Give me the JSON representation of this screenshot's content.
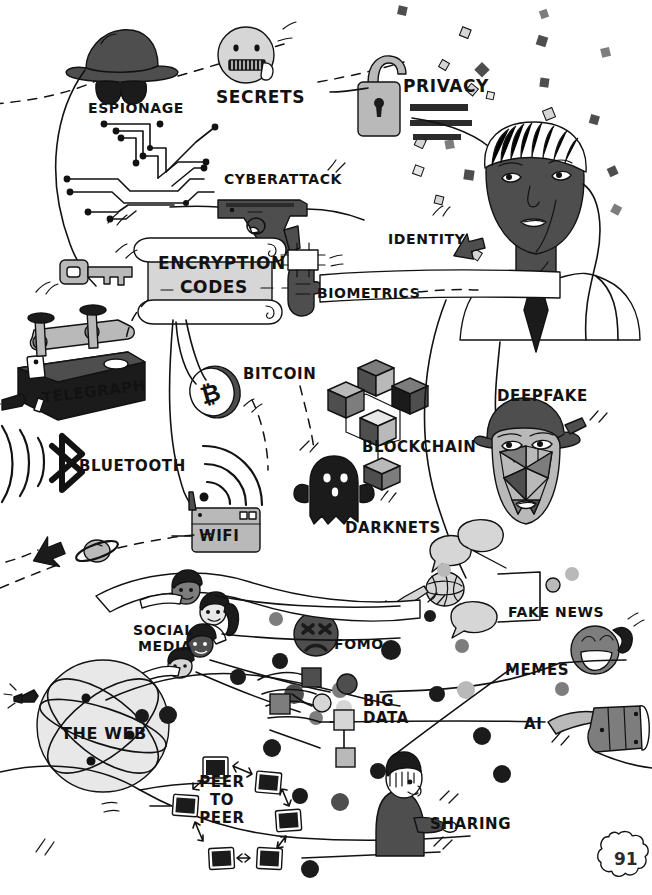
{
  "page": {
    "page_number": "91",
    "background_color": "#ffffff",
    "ink_color": "#121212"
  },
  "palette": {
    "ink": "#121212",
    "black_fill": "#1b1b1b",
    "dark_gray": "#4e4e4e",
    "mid_gray": "#7d7d7d",
    "light_gray": "#b9b9b9",
    "pale_gray": "#d6d6d6",
    "very_pale": "#e8e8e8"
  },
  "labels": [
    {
      "id": "espionage",
      "text": "ESPIONAGE",
      "x": 88,
      "y": 101,
      "size": 14,
      "align": "left",
      "icon": "spy-hat-sunglasses-icon"
    },
    {
      "id": "secrets",
      "text": "SECRETS",
      "x": 216,
      "y": 89,
      "size": 17,
      "align": "left",
      "icon": "zipper-mouth-face-icon"
    },
    {
      "id": "privacy",
      "text": "PRIVACY",
      "x": 403,
      "y": 78,
      "size": 17,
      "align": "left",
      "icon": "open-padlock-icon"
    },
    {
      "id": "cyberattack",
      "text": "CYBERATTACK",
      "x": 224,
      "y": 172,
      "size": 14,
      "align": "left",
      "icon": "handgun-icon"
    },
    {
      "id": "identity",
      "text": "IDENTITY",
      "x": 388,
      "y": 232,
      "size": 14,
      "align": "left",
      "icon": "arrow-pointing-icon"
    },
    {
      "id": "encryption",
      "text": "ENCRYPTION",
      "x": 158,
      "y": 255,
      "size": 17,
      "align": "left",
      "icon": "scroll-icon"
    },
    {
      "id": "codes",
      "text": "CODES",
      "x": 180,
      "y": 279,
      "size": 17,
      "align": "left",
      "icon": "scroll-icon"
    },
    {
      "id": "biometrics",
      "text": "BIOMETRICS",
      "x": 317,
      "y": 286,
      "size": 14,
      "align": "left",
      "icon": "thumbprint-scanner-icon"
    },
    {
      "id": "telegraph",
      "text": "TELEGRAPH",
      "x": 41,
      "y": 391,
      "size": 15,
      "align": "left",
      "icon": "telegraph-key-icon"
    },
    {
      "id": "bitcoin",
      "text": "BITCOIN",
      "x": 243,
      "y": 367,
      "size": 15,
      "align": "left",
      "icon": "bitcoin-coin-icon"
    },
    {
      "id": "deepfake",
      "text": "DEEPFAKE",
      "x": 497,
      "y": 389,
      "size": 15,
      "align": "left",
      "icon": "deepfake-mask-icon"
    },
    {
      "id": "blockchain",
      "text": "BLOCKCHAIN",
      "x": 362,
      "y": 440,
      "size": 15,
      "align": "left",
      "icon": "linked-cubes-icon"
    },
    {
      "id": "bluetooth",
      "text": "BLUETOOTH",
      "x": 79,
      "y": 459,
      "size": 15,
      "align": "left",
      "icon": "bluetooth-icon"
    },
    {
      "id": "wifi",
      "text": "WIFI",
      "x": 199,
      "y": 529,
      "size": 15,
      "align": "left",
      "icon": "wifi-router-icon"
    },
    {
      "id": "darknets",
      "text": "DARKNETS",
      "x": 345,
      "y": 521,
      "size": 15,
      "align": "left",
      "icon": "ghost-icon"
    },
    {
      "id": "fake_news",
      "text": "FAKE NEWS",
      "x": 508,
      "y": 605,
      "size": 14,
      "align": "left",
      "icon": "microphone-speech-bubbles-icon"
    },
    {
      "id": "social_1",
      "text": "SOCIAL",
      "x": 133,
      "y": 623,
      "size": 14,
      "align": "left",
      "icon": "people-chain-icon"
    },
    {
      "id": "social_2",
      "text": "MEDIA",
      "x": 138,
      "y": 639,
      "size": 14,
      "align": "left",
      "icon": "people-chain-icon"
    },
    {
      "id": "fomo",
      "text": "FOMO",
      "x": 334,
      "y": 637,
      "size": 14,
      "align": "left",
      "icon": "distressed-face-icon"
    },
    {
      "id": "memes",
      "text": "MEMES",
      "x": 505,
      "y": 663,
      "size": 15,
      "align": "left",
      "icon": "laughing-face-icon"
    },
    {
      "id": "bigdata_1",
      "text": "BIG",
      "x": 363,
      "y": 694,
      "size": 15,
      "align": "left",
      "icon": "node-graph-icon"
    },
    {
      "id": "bigdata_2",
      "text": "DATA",
      "x": 363,
      "y": 711,
      "size": 15,
      "align": "left",
      "icon": "node-graph-icon"
    },
    {
      "id": "web",
      "text": "THE WEB",
      "x": 61,
      "y": 726,
      "size": 16,
      "align": "left",
      "icon": "globe-icon"
    },
    {
      "id": "ai",
      "text": "AI",
      "x": 524,
      "y": 717,
      "size": 15,
      "align": "left",
      "icon": "robot-hand-icon"
    },
    {
      "id": "p2p_1",
      "text": "PEER",
      "x": 221,
      "y": 775,
      "size": 15,
      "align": "center",
      "icon": "computer-ring-icon"
    },
    {
      "id": "p2p_2",
      "text": "TO",
      "x": 221,
      "y": 793,
      "size": 15,
      "align": "center",
      "icon": "computer-ring-icon"
    },
    {
      "id": "p2p_3",
      "text": "PEER",
      "x": 221,
      "y": 811,
      "size": 15,
      "align": "center",
      "icon": "computer-ring-icon"
    },
    {
      "id": "sharing",
      "text": "SHARING",
      "x": 430,
      "y": 817,
      "size": 15,
      "align": "left",
      "icon": "person-sharing-icon"
    }
  ],
  "icons": [
    {
      "name": "spy-hat-sunglasses-icon",
      "label": "ESPIONAGE"
    },
    {
      "name": "zipper-mouth-face-icon",
      "label": "SECRETS"
    },
    {
      "name": "open-padlock-icon",
      "label": "PRIVACY"
    },
    {
      "name": "circuit-board-icon",
      "label": ""
    },
    {
      "name": "handgun-icon",
      "label": "CYBERATTACK"
    },
    {
      "name": "key-icon",
      "label": ""
    },
    {
      "name": "scroll-icon",
      "label": "ENCRYPTION CODES"
    },
    {
      "name": "thumbprint-scanner-icon",
      "label": "BIOMETRICS"
    },
    {
      "name": "arrow-pointing-icon",
      "label": "IDENTITY"
    },
    {
      "name": "man-portrait-icon",
      "label": ""
    },
    {
      "name": "telegraph-key-icon",
      "label": "TELEGRAPH"
    },
    {
      "name": "bitcoin-coin-icon",
      "label": "BITCOIN"
    },
    {
      "name": "linked-cubes-icon",
      "label": "BLOCKCHAIN"
    },
    {
      "name": "deepfake-mask-icon",
      "label": "DEEPFAKE"
    },
    {
      "name": "bluetooth-icon",
      "label": "BLUETOOTH"
    },
    {
      "name": "wifi-router-icon",
      "label": "WIFI"
    },
    {
      "name": "ghost-icon",
      "label": "DARKNETS"
    },
    {
      "name": "saturn-planet-icon",
      "label": ""
    },
    {
      "name": "black-arrow-icon",
      "label": ""
    },
    {
      "name": "microphone-speech-bubbles-icon",
      "label": "FAKE NEWS"
    },
    {
      "name": "people-chain-icon",
      "label": "SOCIAL MEDIA"
    },
    {
      "name": "distressed-face-icon",
      "label": "FOMO"
    },
    {
      "name": "laughing-face-icon",
      "label": "MEMES"
    },
    {
      "name": "node-graph-icon",
      "label": "BIG DATA"
    },
    {
      "name": "globe-icon",
      "label": "THE WEB"
    },
    {
      "name": "robot-hand-icon",
      "label": "AI"
    },
    {
      "name": "computer-ring-icon",
      "label": "PEER TO PEER"
    },
    {
      "name": "person-sharing-icon",
      "label": "SHARING"
    },
    {
      "name": "page-number-badge-icon",
      "label": "91"
    }
  ]
}
